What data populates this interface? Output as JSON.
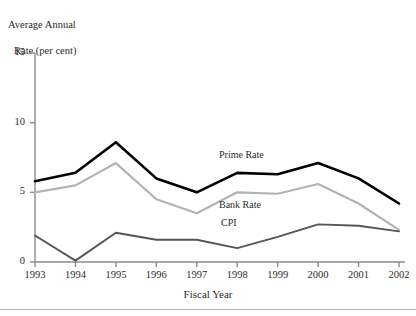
{
  "figure": {
    "y_caption_line1": "Average Annual",
    "y_caption_line2": "Rate (per cent)",
    "x_axis_title": "Fiscal Year",
    "bottom_rule_color": "#b9b9b9"
  },
  "chart_data": {
    "type": "line",
    "title": "Average Annual Rate (per cent)",
    "xlabel": "Fiscal Year",
    "ylabel": "Average Annual Rate (per cent)",
    "categories": [
      "1993",
      "1994",
      "1995",
      "1996",
      "1997",
      "1998",
      "1999",
      "2000",
      "2001",
      "2002"
    ],
    "x": [
      1993,
      1994,
      1995,
      1996,
      1997,
      1998,
      1999,
      2000,
      2001,
      2002
    ],
    "ylim": [
      0,
      15
    ],
    "xlim": [
      1993,
      2002
    ],
    "yticks": [
      0,
      5,
      10,
      15
    ],
    "ytick_labels": [
      "0",
      "5",
      "10",
      "15"
    ],
    "grid": false,
    "legend_position": "inline-annotations",
    "series": [
      {
        "name": "Prime Rate",
        "color": "#000000",
        "width": 2.6,
        "values": [
          5.8,
          6.4,
          8.6,
          6.0,
          5.0,
          6.4,
          6.3,
          7.1,
          6.0,
          4.2
        ],
        "label_x": 1997.55,
        "label_y": 7.6
      },
      {
        "name": "Bank Rate",
        "color": "#b3b3b3",
        "width": 2.2,
        "values": [
          5.0,
          5.5,
          7.1,
          4.5,
          3.5,
          5.0,
          4.9,
          5.6,
          4.2,
          2.3
        ],
        "label_x": 1997.55,
        "label_y": 4.05
      },
      {
        "name": "CPI",
        "color": "#555555",
        "width": 1.9,
        "values": [
          1.9,
          0.1,
          2.1,
          1.6,
          1.6,
          1.0,
          1.8,
          2.7,
          2.6,
          2.2
        ],
        "label_x": 1997.6,
        "label_y": 2.75
      }
    ]
  }
}
